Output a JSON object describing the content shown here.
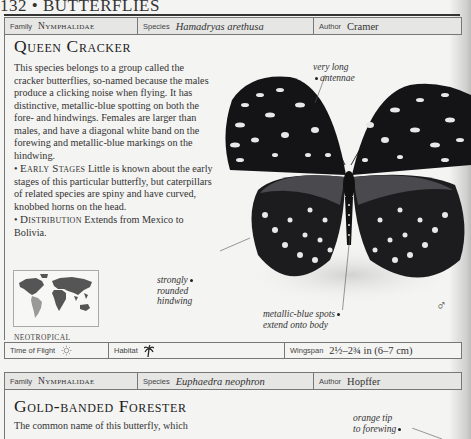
{
  "page": {
    "running_head": "132 • BUTTERFLIES"
  },
  "entry1": {
    "header": {
      "family_label": "Family",
      "family_value": "Nymphalidae",
      "species_label": "Species",
      "species_value": "Hamadryas arethusa",
      "author_label": "Author",
      "author_value": "Cramer"
    },
    "title": "Queen Cracker",
    "description": "This species belongs to a group called the cracker butterflies, so-named because the males produce a clicking noise when flying. It has distinctive, metallic-blue spotting on both the fore- and hindwings. Females are larger than males, and have a diagonal white band on the forewing and metallic-blue markings on the hindwing.",
    "early_stages": {
      "label": "Early Stages",
      "text": "Little is known about the early stages of this particular butterfly, but caterpillars of related species are spiny and have curved, knobbed horns on the head."
    },
    "distribution": {
      "label": "Distribution",
      "text": "Extends from Mexico to Bolivia."
    },
    "map_region": "NEOTROPICAL",
    "annotations": {
      "antennae": [
        "very long",
        "antennae"
      ],
      "hindwing": [
        "strongly",
        "rounded",
        "hindwing"
      ],
      "spots": [
        "metallic-blue spots",
        "extend onto body"
      ]
    },
    "sex_symbol": "♂",
    "footer": {
      "time_label": "Time of Flight",
      "time_icon": "sun-icon",
      "habitat_label": "Habitat",
      "habitat_icon": "palm-tree-icon",
      "wingspan_label": "Wingspan",
      "wingspan_value": "2½–2¾ in (6–7 cm)"
    }
  },
  "entry2": {
    "header": {
      "family_label": "Family",
      "family_value": "Nymphalidae",
      "species_label": "Species",
      "species_value": "Euphaedra neophron",
      "author_label": "Author",
      "author_value": "Hopffer"
    },
    "title": "Gold-banded Forester",
    "description_start": "The common name of this butterfly, which",
    "annotations": {
      "tip": [
        "orange tip",
        "to forewing"
      ]
    }
  }
}
